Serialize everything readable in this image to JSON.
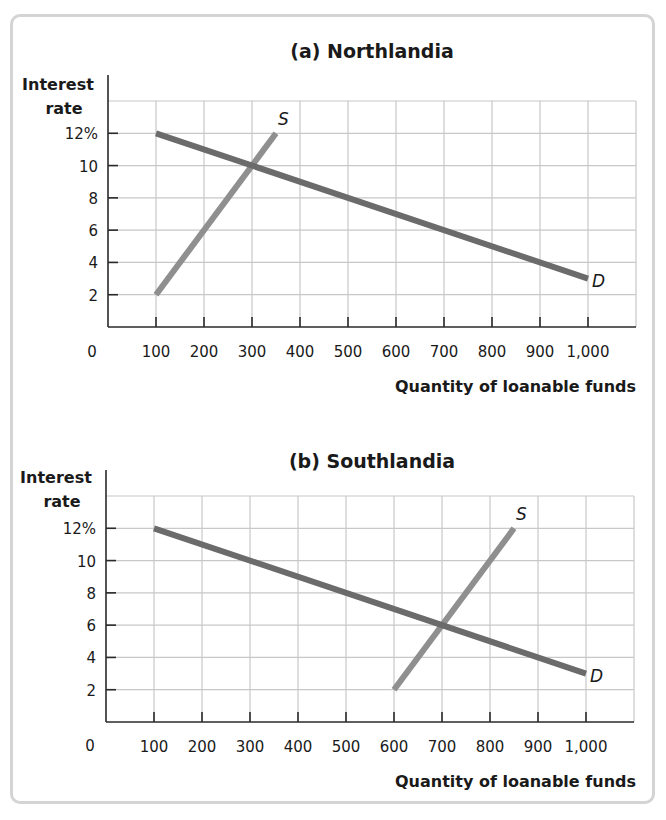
{
  "chart_data": [
    {
      "type": "line",
      "title": "(a) Northlandia",
      "xlabel": "Quantity of loanable funds",
      "ylabel": "Interest rate",
      "ylabel_lines": [
        "Interest",
        "rate"
      ],
      "xlim": [
        0,
        1100
      ],
      "ylim": [
        0,
        14
      ],
      "grid": true,
      "x_ticks": [
        100,
        200,
        300,
        400,
        500,
        600,
        700,
        800,
        900,
        1000
      ],
      "x_tick_labels": [
        "100",
        "200",
        "300",
        "400",
        "500",
        "600",
        "700",
        "800",
        "900",
        "1,000"
      ],
      "y_ticks": [
        2,
        4,
        6,
        8,
        10,
        12
      ],
      "y_tick_labels": [
        "2",
        "4",
        "6",
        "8",
        "10",
        "12%"
      ],
      "origin_label": "0",
      "series": [
        {
          "name": "S",
          "label": "S",
          "color": "#8f8f8f",
          "points": [
            [
              100,
              2
            ],
            [
              350,
              12
            ]
          ]
        },
        {
          "name": "D",
          "label": "D",
          "color": "#6b6b6b",
          "points": [
            [
              100,
              12
            ],
            [
              1000,
              3
            ]
          ]
        }
      ],
      "equilibrium": {
        "quantity": 300,
        "interest_rate": 10
      }
    },
    {
      "type": "line",
      "title": "(b) Southlandia",
      "xlabel": "Quantity of loanable funds",
      "ylabel": "Interest rate",
      "ylabel_lines": [
        "Interest",
        "rate"
      ],
      "xlim": [
        0,
        1100
      ],
      "ylim": [
        0,
        14
      ],
      "grid": true,
      "x_ticks": [
        100,
        200,
        300,
        400,
        500,
        600,
        700,
        800,
        900,
        1000
      ],
      "x_tick_labels": [
        "100",
        "200",
        "300",
        "400",
        "500",
        "600",
        "700",
        "800",
        "900",
        "1,000"
      ],
      "y_ticks": [
        2,
        4,
        6,
        8,
        10,
        12
      ],
      "y_tick_labels": [
        "2",
        "4",
        "6",
        "8",
        "10",
        "12%"
      ],
      "origin_label": "0",
      "series": [
        {
          "name": "S",
          "label": "S",
          "color": "#8f8f8f",
          "points": [
            [
              600,
              2
            ],
            [
              850,
              12
            ]
          ]
        },
        {
          "name": "D",
          "label": "D",
          "color": "#6b6b6b",
          "points": [
            [
              100,
              12
            ],
            [
              1000,
              3
            ]
          ]
        }
      ],
      "equilibrium": {
        "quantity": 700,
        "interest_rate": 6
      }
    }
  ],
  "colors": {
    "grid": "#c8c8c8",
    "axis": "#2a2a2a",
    "frame": "#d4d4d4"
  }
}
